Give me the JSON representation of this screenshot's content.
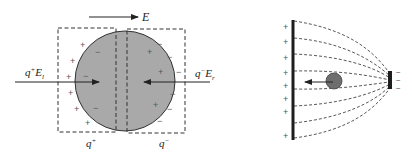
{
  "left_figure": {
    "field_label": "E",
    "left_force_label": "q",
    "left_force_sup": "+",
    "left_force_E": "E",
    "left_force_sub": "l",
    "right_force_label": "q",
    "right_force_sup": "−",
    "right_force_E": "E",
    "right_force_sub": "r",
    "left_half_label": "q",
    "left_half_sup": "+",
    "right_half_label": "q",
    "right_half_sup": "−",
    "plus_sign": "+",
    "minus_sign": "−",
    "colors": {
      "sphere_fill": "#a9a9a9",
      "stroke": "#333333"
    }
  },
  "right_figure": {
    "plate_left_sign": "+",
    "plate_right_sign": "−",
    "colors": {
      "particle_fill": "#6e6e6e",
      "plate": "#1e1e1e",
      "field_lines": "#444444"
    }
  }
}
